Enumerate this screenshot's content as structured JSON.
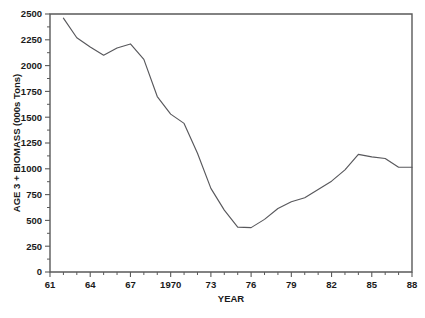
{
  "chart_data": {
    "type": "line",
    "title": "",
    "xlabel": "YEAR",
    "ylabel": "AGE 3 + BIOMASS  (000s Tons)",
    "xlim": [
      1961,
      1988
    ],
    "ylim": [
      0,
      2500
    ],
    "grid": false,
    "legend": null,
    "x_tick_labels": [
      "61",
      "64",
      "67",
      "1970",
      "73",
      "76",
      "79",
      "82",
      "85",
      "88"
    ],
    "x_tick_values": [
      1961,
      1964,
      1967,
      1970,
      1973,
      1976,
      1979,
      1982,
      1985,
      1988
    ],
    "x_minor_step": 1,
    "y_tick_labels": [
      "0",
      "250",
      "500",
      "750",
      "1000",
      "1250",
      "1500",
      "1750",
      "2000",
      "2250",
      "2500"
    ],
    "y_tick_values": [
      0,
      250,
      500,
      750,
      1000,
      1250,
      1500,
      1750,
      2000,
      2250,
      2500
    ],
    "y_minor_step": 125,
    "line_color": "#58585c",
    "axis_color": "#5a5a5a",
    "background_color": "#ffffff",
    "x": [
      1962,
      1963,
      1964,
      1965,
      1966,
      1967,
      1968,
      1969,
      1970,
      1971,
      1972,
      1973,
      1974,
      1975,
      1976,
      1977,
      1978,
      1979,
      1980,
      1981,
      1982,
      1983,
      1984,
      1985,
      1986,
      1987,
      1988
    ],
    "values": [
      2460,
      2270,
      2180,
      2100,
      2170,
      2210,
      2060,
      1700,
      1530,
      1440,
      1150,
      810,
      600,
      435,
      430,
      510,
      615,
      680,
      720,
      800,
      880,
      990,
      1140,
      1115,
      1100,
      1015,
      1015
    ],
    "series": [
      {
        "name": "AGE 3 + BIOMASS",
        "values": [
          2460,
          2270,
          2180,
          2100,
          2170,
          2210,
          2060,
          1700,
          1530,
          1440,
          1150,
          810,
          600,
          435,
          430,
          510,
          615,
          680,
          720,
          800,
          880,
          990,
          1140,
          1115,
          1100,
          1015,
          1015
        ]
      }
    ]
  }
}
